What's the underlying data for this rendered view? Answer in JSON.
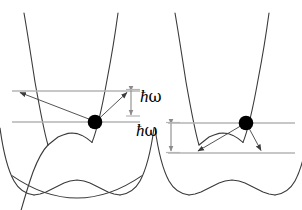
{
  "figure": {
    "width": 302,
    "height": 210,
    "background_color": "#ffffff",
    "curve_color": "#3a3a3a",
    "level_line_color": "#b0b0b0",
    "arrow_color": "#5a5a5a",
    "dimension_arrow_color": "#8a8a8a",
    "marker_color": "#000000"
  },
  "labels": {
    "hbar_omega_upper": "ħω",
    "hbar_omega_lower": "ħω",
    "hbar_glyph": "ħ",
    "omega_glyph": "ω"
  },
  "panels": [
    {
      "id": "left-panel",
      "name": "absorption-panel",
      "description": "Electron at minimum of upper parabola on lower level; arrows go up-left and up-right to the upper level",
      "marker": {
        "x": 95,
        "y": 122,
        "r": 7.5
      },
      "levels": [
        {
          "name": "upper-level",
          "y": 91,
          "x1": 12,
          "x2": 140
        },
        {
          "name": "lower-level",
          "y": 122,
          "x1": 12,
          "x2": 140
        }
      ],
      "transition_arrows": [
        {
          "name": "left-up-arrow",
          "from_x": 95,
          "from_y": 122,
          "to_x": 18,
          "to_y": 92
        },
        {
          "name": "right-up-arrow",
          "from_x": 95,
          "from_y": 122,
          "to_x": 129,
          "to_y": 92
        }
      ],
      "parabolas": [
        {
          "name": "ground-state-parabola",
          "vertex_x": 77,
          "vertex_y": 198,
          "a": 0.0155
        },
        {
          "name": "excited-state-parabola",
          "vertex_x": 72,
          "vertex_y": 133,
          "a": 0.0265
        }
      ]
    },
    {
      "id": "right-panel",
      "name": "emission-panel",
      "description": "Electron at upper level at minimum of upper parabola; arrows go down-left and down-right to the lower level",
      "marker": {
        "x": 246,
        "y": 123,
        "r": 7.5
      },
      "levels": [
        {
          "name": "upper-level",
          "y": 123,
          "x1": 168,
          "x2": 295
        },
        {
          "name": "lower-level",
          "y": 153,
          "x1": 168,
          "x2": 295
        }
      ],
      "transition_arrows": [
        {
          "name": "left-down-arrow",
          "from_x": 246,
          "from_y": 123,
          "to_x": 196,
          "to_y": 152
        },
        {
          "name": "right-down-arrow",
          "from_x": 246,
          "from_y": 123,
          "to_x": 263,
          "to_y": 152
        }
      ],
      "parabolas": [
        {
          "name": "ground-state-parabola",
          "vertex_x": 232,
          "vertex_y": 198,
          "a": 0.0155
        },
        {
          "name": "excited-state-parabola",
          "vertex_x": 223,
          "vertex_y": 133,
          "a": 0.0265
        }
      ]
    }
  ],
  "dimension_markers": [
    {
      "name": "hbar-omega-upper-dimension",
      "x": 131,
      "y_top": 89,
      "y_bottom": 113,
      "label_key": "hbar_omega_upper",
      "label_x": 139,
      "label_y": 91
    },
    {
      "name": "hbar-omega-lower-dimension",
      "x": 171,
      "y_top": 121,
      "y_bottom": 152,
      "label_key": "hbar_omega_lower",
      "label_x": 136,
      "label_y": 124
    }
  ]
}
